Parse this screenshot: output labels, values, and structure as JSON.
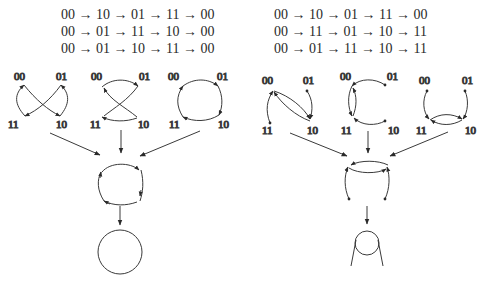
{
  "left_panel": {
    "sequences": [
      "00 → 10 → 01 → 11 → 00",
      "00 → 01 → 11 → 10 → 00",
      "00 → 01 → 10 → 11 → 00"
    ],
    "graphs": [
      {
        "nodes": [
          "00",
          "01",
          "11",
          "10"
        ]
      },
      {
        "nodes": [
          "00",
          "01",
          "11",
          "10"
        ]
      },
      {
        "nodes": [
          "00",
          "01",
          "11",
          "10"
        ]
      }
    ],
    "result": "circle"
  },
  "right_panel": {
    "sequences": [
      "00 → 10 → 01 → 11 → 00",
      "00 → 11 → 01 → 10 → 11",
      "00 → 01 → 11 → 10 → 11"
    ],
    "graphs": [
      {
        "nodes": [
          "00",
          "01",
          "11",
          "10"
        ]
      },
      {
        "nodes": [
          "00",
          "01",
          "11",
          "10"
        ]
      },
      {
        "nodes": [
          "00",
          "01",
          "11",
          "10"
        ]
      }
    ],
    "result": "loop-with-tails"
  },
  "labels": {
    "n00": "00",
    "n01": "01",
    "n10": "10",
    "n11": "11"
  }
}
